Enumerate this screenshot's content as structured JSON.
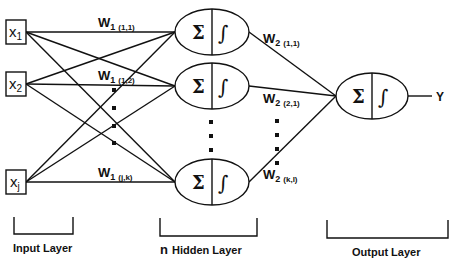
{
  "diagram": {
    "type": "neural-network",
    "inputs": [
      {
        "label": "x",
        "sub": "1"
      },
      {
        "label": "x",
        "sub": "2"
      },
      {
        "label": "x",
        "sub": "j"
      }
    ],
    "hidden_node_symbols": {
      "sum": "Σ",
      "activation": "∫"
    },
    "output_node_symbols": {
      "sum": "Σ",
      "activation": "∫"
    },
    "output_label": "Y",
    "weights_layer1": [
      {
        "base": "W",
        "layer": "1",
        "idx": "(1,1)"
      },
      {
        "base": "W",
        "layer": "1",
        "idx": "(1,2)"
      },
      {
        "base": "W",
        "layer": "1",
        "idx": "(j,k)"
      }
    ],
    "weights_layer2": [
      {
        "base": "W",
        "layer": "2",
        "idx": "(1,1)"
      },
      {
        "base": "W",
        "layer": "2",
        "idx": "(2,1)"
      },
      {
        "base": "W",
        "layer": "2",
        "idx": "(k,l)"
      }
    ],
    "layer_labels": {
      "input": "Input Layer",
      "hidden_prefix": "n",
      "hidden": "Hidden Layer",
      "output": "Output Layer"
    },
    "colors": {
      "stroke": "#111111",
      "background": "#ffffff"
    }
  }
}
